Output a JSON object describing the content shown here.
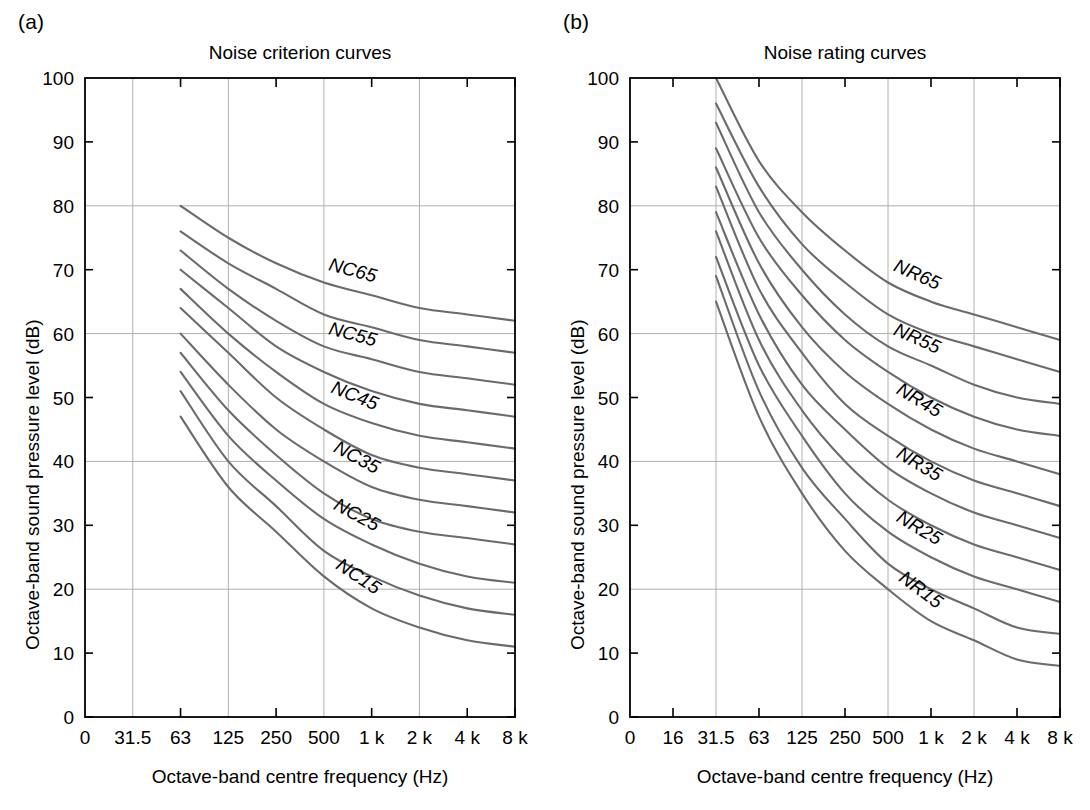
{
  "figure": {
    "width": 1090,
    "height": 810,
    "background": "#ffffff",
    "curve_color": "#6b6b6b",
    "axis_color": "#000000",
    "grid_color": "#b0b0b0"
  },
  "panels": [
    {
      "id": "a",
      "label": "(a)",
      "title": "Noise criterion curves",
      "xlabel": "Octave-band centre frequency (Hz)",
      "ylabel": "Octave-band sound pressure level (dB)"
    },
    {
      "id": "b",
      "label": "(b)",
      "title": "Noise rating curves",
      "xlabel": "Octave-band centre frequency (Hz)",
      "ylabel": "Octave-band sound pressure level (dB)"
    }
  ],
  "chart_data": [
    {
      "type": "line",
      "panel": "a",
      "title": "Noise criterion curves",
      "xlabel": "Octave-band centre frequency (Hz)",
      "ylabel": "Octave-band sound pressure level (dB)",
      "xticklabels": [
        "0",
        "31.5",
        "63",
        "125",
        "250",
        "500",
        "1 k",
        "2 k",
        "4 k",
        "8 k"
      ],
      "x": [
        0,
        31.5,
        63,
        125,
        250,
        500,
        1000,
        2000,
        4000,
        8000
      ],
      "yticklabels": [
        "0",
        "10",
        "20",
        "30",
        "40",
        "50",
        "60",
        "70",
        "80",
        "90",
        "100"
      ],
      "ylim": [
        0,
        100
      ],
      "ytick_step": 10,
      "ygrid_values": [
        20,
        40,
        60,
        80,
        100
      ],
      "xgrid_labels": [
        "31.5",
        "125",
        "500",
        "2 k"
      ],
      "grid": true,
      "legend": "inline-curve-labels",
      "curve_start_label": "63",
      "series": [
        {
          "name": "NC65",
          "label": "NC65",
          "categories": [
            "63",
            "125",
            "250",
            "500",
            "1 k",
            "2 k",
            "4 k",
            "8 k"
          ],
          "values": [
            80,
            75,
            71,
            68,
            66,
            64,
            63,
            62
          ]
        },
        {
          "name": "NC60",
          "label": "",
          "categories": [
            "63",
            "125",
            "250",
            "500",
            "1 k",
            "2 k",
            "4 k",
            "8 k"
          ],
          "values": [
            76,
            71,
            67,
            63,
            61,
            59,
            58,
            57
          ]
        },
        {
          "name": "NC55",
          "label": "NC55",
          "categories": [
            "63",
            "125",
            "250",
            "500",
            "1 k",
            "2 k",
            "4 k",
            "8 k"
          ],
          "values": [
            73,
            67,
            62,
            58,
            56,
            54,
            53,
            52
          ]
        },
        {
          "name": "NC50",
          "label": "",
          "categories": [
            "63",
            "125",
            "250",
            "500",
            "1 k",
            "2 k",
            "4 k",
            "8 k"
          ],
          "values": [
            70,
            64,
            58,
            54,
            51,
            49,
            48,
            47
          ]
        },
        {
          "name": "NC45",
          "label": "NC45",
          "categories": [
            "63",
            "125",
            "250",
            "500",
            "1 k",
            "2 k",
            "4 k",
            "8 k"
          ],
          "values": [
            67,
            60,
            54,
            49,
            46,
            44,
            43,
            42
          ]
        },
        {
          "name": "NC40",
          "label": "",
          "categories": [
            "63",
            "125",
            "250",
            "500",
            "1 k",
            "2 k",
            "4 k",
            "8 k"
          ],
          "values": [
            64,
            57,
            50,
            45,
            41,
            39,
            38,
            37
          ]
        },
        {
          "name": "NC35",
          "label": "NC35",
          "categories": [
            "63",
            "125",
            "250",
            "500",
            "1 k",
            "2 k",
            "4 k",
            "8 k"
          ],
          "values": [
            60,
            52,
            45,
            40,
            36,
            34,
            33,
            32
          ]
        },
        {
          "name": "NC30",
          "label": "",
          "categories": [
            "63",
            "125",
            "250",
            "500",
            "1 k",
            "2 k",
            "4 k",
            "8 k"
          ],
          "values": [
            57,
            48,
            41,
            35,
            31,
            29,
            28,
            27
          ]
        },
        {
          "name": "NC25",
          "label": "NC25",
          "categories": [
            "63",
            "125",
            "250",
            "500",
            "1 k",
            "2 k",
            "4 k",
            "8 k"
          ],
          "values": [
            54,
            44,
            37,
            31,
            27,
            24,
            22,
            21
          ]
        },
        {
          "name": "NC20",
          "label": "",
          "categories": [
            "63",
            "125",
            "250",
            "500",
            "1 k",
            "2 k",
            "4 k",
            "8 k"
          ],
          "values": [
            51,
            40,
            33,
            26,
            22,
            19,
            17,
            16
          ]
        },
        {
          "name": "NC15",
          "label": "NC15",
          "categories": [
            "63",
            "125",
            "250",
            "500",
            "1 k",
            "2 k",
            "4 k",
            "8 k"
          ],
          "values": [
            47,
            36,
            29,
            22,
            17,
            14,
            12,
            11
          ]
        }
      ],
      "curve_labels": [
        "NC65",
        "NC55",
        "NC45",
        "NC35",
        "NC25",
        "NC15"
      ]
    },
    {
      "type": "line",
      "panel": "b",
      "title": "Noise rating curves",
      "xlabel": "Octave-band centre frequency (Hz)",
      "ylabel": "Octave-band sound pressure level (dB)",
      "xticklabels": [
        "0",
        "16",
        "31.5",
        "63",
        "125",
        "250",
        "500",
        "1 k",
        "2 k",
        "4 k",
        "8 k"
      ],
      "x": [
        0,
        16,
        31.5,
        63,
        125,
        250,
        500,
        1000,
        2000,
        4000,
        8000
      ],
      "yticklabels": [
        "0",
        "10",
        "20",
        "30",
        "40",
        "50",
        "60",
        "70",
        "80",
        "90",
        "100"
      ],
      "ylim": [
        0,
        100
      ],
      "ytick_step": 10,
      "ygrid_values": [
        20,
        40,
        60,
        80,
        100
      ],
      "xgrid_labels": [
        "31.5",
        "125",
        "500",
        "2 k"
      ],
      "grid": true,
      "legend": "inline-curve-labels",
      "curve_start_label": "31.5",
      "series": [
        {
          "name": "NR65",
          "label": "NR65",
          "categories": [
            "31.5",
            "63",
            "125",
            "250",
            "500",
            "1 k",
            "2 k",
            "4 k",
            "8 k"
          ],
          "values": [
            100,
            87,
            79,
            73,
            68,
            65,
            63,
            61,
            59
          ]
        },
        {
          "name": "NR60",
          "label": "",
          "categories": [
            "31.5",
            "63",
            "125",
            "250",
            "500",
            "1 k",
            "2 k",
            "4 k",
            "8 k"
          ],
          "values": [
            96,
            83,
            74,
            68,
            63,
            60,
            58,
            56,
            54
          ]
        },
        {
          "name": "NR55",
          "label": "NR55",
          "categories": [
            "31.5",
            "63",
            "125",
            "250",
            "500",
            "1 k",
            "2 k",
            "4 k",
            "8 k"
          ],
          "values": [
            93,
            79,
            70,
            63,
            58,
            55,
            52,
            50,
            49
          ]
        },
        {
          "name": "NR50",
          "label": "",
          "categories": [
            "31.5",
            "63",
            "125",
            "250",
            "500",
            "1 k",
            "2 k",
            "4 k",
            "8 k"
          ],
          "values": [
            89,
            75,
            66,
            59,
            54,
            50,
            47,
            45,
            44
          ]
        },
        {
          "name": "NR45",
          "label": "NR45",
          "categories": [
            "31.5",
            "63",
            "125",
            "250",
            "500",
            "1 k",
            "2 k",
            "4 k",
            "8 k"
          ],
          "values": [
            86,
            71,
            61,
            54,
            49,
            45,
            42,
            40,
            38
          ]
        },
        {
          "name": "NR40",
          "label": "",
          "categories": [
            "31.5",
            "63",
            "125",
            "250",
            "500",
            "1 k",
            "2 k",
            "4 k",
            "8 k"
          ],
          "values": [
            83,
            67,
            57,
            49,
            44,
            40,
            37,
            35,
            33
          ]
        },
        {
          "name": "NR35",
          "label": "NR35",
          "categories": [
            "31.5",
            "63",
            "125",
            "250",
            "500",
            "1 k",
            "2 k",
            "4 k",
            "8 k"
          ],
          "values": [
            79,
            63,
            52,
            45,
            39,
            35,
            32,
            30,
            28
          ]
        },
        {
          "name": "NR30",
          "label": "",
          "categories": [
            "31.5",
            "63",
            "125",
            "250",
            "500",
            "1 k",
            "2 k",
            "4 k",
            "8 k"
          ],
          "values": [
            76,
            59,
            48,
            40,
            34,
            30,
            27,
            25,
            23
          ]
        },
        {
          "name": "NR25",
          "label": "NR25",
          "categories": [
            "31.5",
            "63",
            "125",
            "250",
            "500",
            "1 k",
            "2 k",
            "4 k",
            "8 k"
          ],
          "values": [
            72,
            55,
            44,
            35,
            29,
            25,
            22,
            20,
            18
          ]
        },
        {
          "name": "NR20",
          "label": "",
          "categories": [
            "31.5",
            "63",
            "125",
            "250",
            "500",
            "1 k",
            "2 k",
            "4 k",
            "8 k"
          ],
          "values": [
            69,
            51,
            39,
            31,
            24,
            20,
            17,
            14,
            13
          ]
        },
        {
          "name": "NR15",
          "label": "NR15",
          "categories": [
            "31.5",
            "63",
            "125",
            "250",
            "500",
            "1 k",
            "2 k",
            "4 k",
            "8 k"
          ],
          "values": [
            65,
            47,
            35,
            26,
            20,
            15,
            12,
            9,
            8
          ]
        }
      ],
      "curve_labels": [
        "NR65",
        "NR55",
        "NR45",
        "NR35",
        "NR25",
        "NR15"
      ]
    }
  ]
}
